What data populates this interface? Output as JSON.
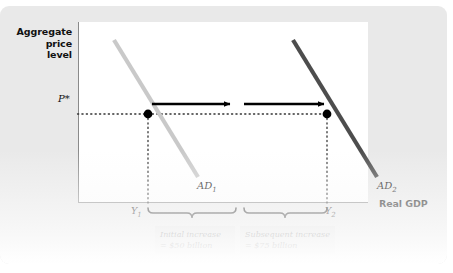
{
  "figure": {
    "axes": {
      "y_title": [
        "Aggregate",
        "price",
        "level"
      ],
      "y_title_text": "Aggregate price level",
      "x_title": "Real GDP",
      "y_tick_label": "P*",
      "x_tick_labels": [
        "Y1",
        "Y2"
      ]
    },
    "curves": [
      {
        "id": "AD1",
        "label": "AD",
        "subscript": "1",
        "color": "#c9c9c9",
        "x1": 36,
        "y1": 18,
        "x2": 120,
        "y2": 155
      },
      {
        "id": "AD2",
        "label": "AD",
        "subscript": "2",
        "color": "#4d4d4d",
        "x1": 215,
        "y1": 18,
        "x2": 299,
        "y2": 155
      }
    ],
    "equilibria": [
      {
        "id": "E1",
        "x": 70,
        "y": 92,
        "label": "Y1"
      },
      {
        "id": "E2",
        "x": 249,
        "y": 92,
        "label": "Y2"
      }
    ],
    "shift_arrows": [
      {
        "id": "initial-shift-arrow",
        "x_start": 74,
        "x_end": 158,
        "y": 82
      },
      {
        "id": "subsequent-shift-arrow",
        "x_start": 166,
        "x_end": 252,
        "y": 82
      }
    ],
    "braces": [
      {
        "id": "initial-increase-brace",
        "x_start": 70,
        "x_end": 158,
        "caption_line_1": "Initial increase",
        "caption_line_2": "= $50 billion"
      },
      {
        "id": "subsequent-increase-brace",
        "x_start": 166,
        "x_end": 249,
        "caption_line_1": "Subsequent increase",
        "caption_line_2": "= $75 billion"
      }
    ],
    "colors": {
      "panel_background": "#e9e9e9",
      "plot_background": "#ffffff",
      "axis": "#8a8a8a",
      "ad1": "#c9c9c9",
      "ad2": "#4d4d4d",
      "arrow": "#000000",
      "caption_background": "#dcdcdc",
      "dotted_guide": "#3a3a3a"
    }
  }
}
